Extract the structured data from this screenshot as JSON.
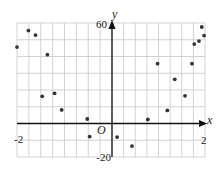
{
  "chart_data": {
    "type": "scatter",
    "title": "",
    "xlabel": "x",
    "ylabel": "y",
    "origin_label": "O",
    "xlim": [
      -2,
      2
    ],
    "ylim": [
      -20,
      60
    ],
    "grid": true,
    "x_grid_step": 0.25,
    "y_grid_step": 10,
    "x_tick_labels": [
      "-2",
      "2"
    ],
    "y_tick_labels": [
      "60",
      "-20"
    ],
    "legend": null,
    "series": [
      {
        "name": "data",
        "color": "#333333",
        "points": [
          {
            "x": -2.0,
            "y": 45.6
          },
          {
            "x": -1.76,
            "y": 55.5
          },
          {
            "x": -1.61,
            "y": 52.8
          },
          {
            "x": -1.47,
            "y": 16.2
          },
          {
            "x": -1.36,
            "y": 41.1
          },
          {
            "x": -1.21,
            "y": 18.0
          },
          {
            "x": -1.06,
            "y": 8.1
          },
          {
            "x": -0.52,
            "y": 2.7
          },
          {
            "x": -0.47,
            "y": -7.8
          },
          {
            "x": 0.11,
            "y": -8.1
          },
          {
            "x": 0.43,
            "y": -13.5
          },
          {
            "x": 0.77,
            "y": 2.4
          },
          {
            "x": 0.98,
            "y": 35.7
          },
          {
            "x": 1.19,
            "y": 7.8
          },
          {
            "x": 1.35,
            "y": 26.4
          },
          {
            "x": 1.57,
            "y": 16.5
          },
          {
            "x": 1.72,
            "y": 35.7
          },
          {
            "x": 1.77,
            "y": 47.4
          },
          {
            "x": 1.87,
            "y": 49.2
          },
          {
            "x": 1.93,
            "y": 57.6
          },
          {
            "x": 1.98,
            "y": 52.5
          }
        ]
      }
    ]
  },
  "colors": {
    "grid": "#c8c8c8",
    "axis": "#111111",
    "point": "#333333",
    "background": "#ffffff"
  }
}
